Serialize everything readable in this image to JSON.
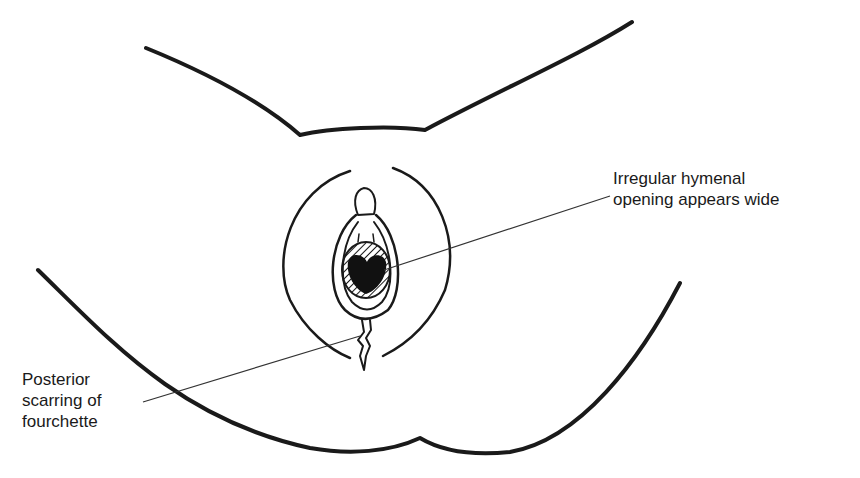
{
  "figure": {
    "type": "anatomical line drawing",
    "annotations": [
      {
        "id": "hymen",
        "lines": [
          "Irregular hymenal",
          "opening appears wide"
        ]
      },
      {
        "id": "fourchette",
        "lines": [
          "Posterior",
          "scarring of",
          "fourchette"
        ]
      }
    ],
    "colors": {
      "ink": "#1a1a1a",
      "background": "#ffffff"
    }
  }
}
